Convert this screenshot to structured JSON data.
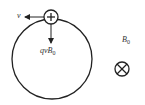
{
  "diagram": {
    "type": "charged particle in circular orbit in magnetic field",
    "colors": {
      "stroke": "#222222",
      "background": "#ffffff"
    },
    "orbit": {
      "cx": 52,
      "cy": 59,
      "r": 40
    },
    "charge": {
      "symbol": "+",
      "cx": 51,
      "cy": 17,
      "r": 7
    },
    "velocity": {
      "label": "v"
    },
    "force": {
      "label_main": "qvB",
      "label_sub": "0"
    },
    "field": {
      "label_main": "B",
      "label_sub": "0",
      "direction_symbol": "into-page"
    }
  }
}
